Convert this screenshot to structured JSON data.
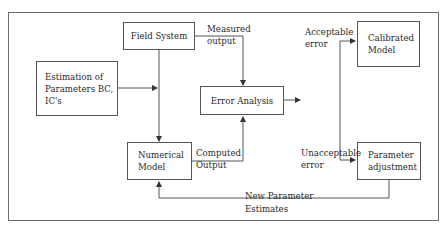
{
  "diagram": {
    "nodes": {
      "field_system": "Field System",
      "estimation": [
        "Estimation of",
        "Parameters BC,",
        "IC's"
      ],
      "error_analysis": "Error Analysis",
      "numerical_model": [
        "Numerical",
        "Model"
      ],
      "calibrated_model": [
        "Calibrated",
        "Model"
      ],
      "parameter_adjustment": [
        "Parameter",
        "adjustment"
      ]
    },
    "edge_labels": {
      "measured_output": [
        "Measured",
        "output"
      ],
      "computed_output": [
        "Computed",
        "Output"
      ],
      "acceptable_error": [
        "Acceptable",
        "error"
      ],
      "unacceptable_error": [
        "Unacceptable",
        "error"
      ],
      "new_parameter_estimates": [
        "New Parameter",
        "Estimates"
      ]
    },
    "colors": {
      "line": "#555555",
      "frame": "#6f6f6f",
      "text": "#2a2a2a"
    }
  }
}
